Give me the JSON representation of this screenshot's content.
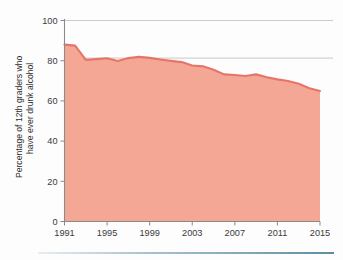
{
  "chart_data": {
    "type": "area",
    "title": "",
    "subtitle": "",
    "xlabel": "",
    "ylabel": "Percentage of 12th graders who have ever drunk alcohol",
    "ylabel_line1": "Percentage of 12th graders who",
    "ylabel_line2": "have ever drunk alcohol",
    "xlim": [
      1991,
      2015
    ],
    "ylim": [
      0,
      100
    ],
    "xticks": [
      1991,
      1995,
      1999,
      2003,
      2007,
      2011,
      2015
    ],
    "xtick_labels": [
      "1991",
      "1995",
      "1999",
      "2003",
      "2007",
      "2011",
      "2015"
    ],
    "yticks": [
      0,
      20,
      40,
      60,
      80,
      100
    ],
    "ytick_labels": [
      "0",
      "20",
      "40",
      "60",
      "80",
      "100"
    ],
    "gridlines": {
      "horizontal": [
        80,
        100
      ],
      "vertical": []
    },
    "legend": {
      "visible": false,
      "position": "none",
      "entries": []
    },
    "x": [
      1991,
      1992,
      1993,
      1994,
      1995,
      1996,
      1997,
      1998,
      1999,
      2000,
      2001,
      2002,
      2003,
      2004,
      2005,
      2006,
      2007,
      2008,
      2009,
      2010,
      2011,
      2012,
      2013,
      2014,
      2015
    ],
    "values": [
      88.0,
      87.5,
      80.4,
      80.8,
      81.2,
      79.9,
      81.3,
      81.9,
      81.4,
      80.6,
      79.9,
      79.3,
      77.6,
      77.2,
      75.5,
      73.2,
      72.9,
      72.4,
      73.2,
      71.8,
      70.7,
      69.9,
      68.5,
      66.3,
      64.9
    ],
    "colors": {
      "fill": "#f5a795",
      "line": "#e5756a",
      "grid": "#bcbcbc",
      "axis": "#8a8a8a",
      "text": "#3a3a3a",
      "background": "#fdfdfd",
      "footer_rule": "#6f9aae"
    }
  }
}
